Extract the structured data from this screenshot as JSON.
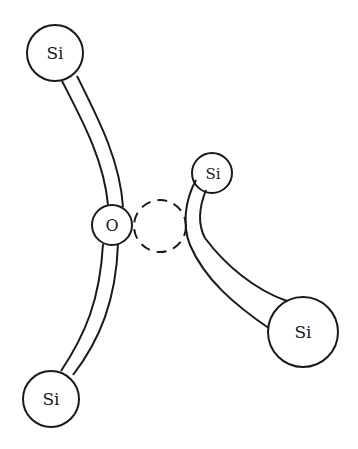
{
  "diagram": {
    "colors": {
      "stroke": "#1a1a1a",
      "fill": "#ffffff",
      "background": "#ffffff"
    },
    "atoms": [
      {
        "id": "si-top",
        "label": "Si",
        "cx": 55,
        "cy": 53,
        "r": 28,
        "font_size": 17
      },
      {
        "id": "oxygen",
        "label": "O",
        "cx": 112,
        "cy": 225,
        "r": 20,
        "font_size": 16
      },
      {
        "id": "si-bottom",
        "label": "Si",
        "cx": 51,
        "cy": 399,
        "r": 28,
        "font_size": 17
      },
      {
        "id": "si-small",
        "label": "Si",
        "cx": 212,
        "cy": 173,
        "r": 20,
        "font_size": 15
      },
      {
        "id": "si-large",
        "label": "Si",
        "cx": 303,
        "cy": 332,
        "r": 35,
        "font_size": 17
      }
    ],
    "vacancy": {
      "id": "vacancy-site",
      "cx": 160,
      "cy": 226,
      "r": 26,
      "style": "dashed"
    },
    "bonds": [
      {
        "id": "bond-si-top-o",
        "from": "si-top",
        "to": "oxygen"
      },
      {
        "id": "bond-o-si-bottom",
        "from": "oxygen",
        "to": "si-bottom"
      },
      {
        "id": "bond-si-small-si-large",
        "from": "si-small",
        "to": "si-large"
      }
    ]
  }
}
